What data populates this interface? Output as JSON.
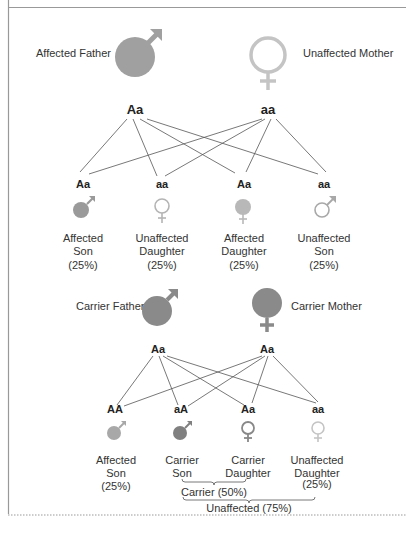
{
  "colors": {
    "affected": "#9a9a9a",
    "affected_light": "#b3b3b3",
    "carrier": "#8a8a8a",
    "unaffected": "#c8c8c8",
    "unaffected_dark": "#9c9c9c",
    "line": "#555555",
    "text": "#333333",
    "frame": "#aaaaaa"
  },
  "cross1": {
    "father": {
      "label": "Affected Father",
      "genotype": "Aa",
      "icon": "male-symbol-filled"
    },
    "mother": {
      "label": "Unaffected Mother",
      "genotype": "aa",
      "icon": "female-symbol-outline"
    },
    "children": [
      {
        "genotype": "Aa",
        "line1": "Affected",
        "line2": "Son",
        "pct": "(25%)",
        "icon": "male-symbol-filled"
      },
      {
        "genotype": "aa",
        "line1": "Unaffected",
        "line2": "Daughter",
        "pct": "(25%)",
        "icon": "female-symbol-outline"
      },
      {
        "genotype": "Aa",
        "line1": "Affected",
        "line2": "Daughter",
        "pct": "(25%)",
        "icon": "female-symbol-filled"
      },
      {
        "genotype": "aa",
        "line1": "Unaffected",
        "line2": "Son",
        "pct": "(25%)",
        "icon": "male-symbol-outline"
      }
    ]
  },
  "cross2": {
    "father": {
      "label": "Carrier Father",
      "genotype": "Aa",
      "icon": "male-symbol-filled"
    },
    "mother": {
      "label": "Carrier Mother",
      "genotype": "Aa",
      "icon": "female-symbol-filled"
    },
    "children": [
      {
        "genotype": "AA",
        "line1": "Affected",
        "line2": "Son",
        "pct": "(25%)",
        "icon": "male-symbol-filled"
      },
      {
        "genotype": "aA",
        "line1": "Carrier",
        "line2": "Son",
        "pct": "",
        "icon": "male-symbol-filled"
      },
      {
        "genotype": "Aa",
        "line1": "Carrier",
        "line2": "Daughter",
        "pct": "",
        "icon": "female-symbol-outline"
      },
      {
        "genotype": "aa",
        "line1": "Unaffected",
        "line2": "Daughter",
        "pct": "(25%)",
        "icon": "female-symbol-outline"
      }
    ],
    "groups": {
      "carrier": "Carrier (50%)",
      "unaffected": "Unaffected (75%)"
    }
  }
}
